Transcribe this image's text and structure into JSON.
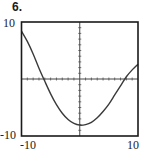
{
  "problem": {
    "number": "6."
  },
  "axes": {
    "y_top_label": "10",
    "y_bottom_label": "-10",
    "x_left_label": "-10",
    "x_right_label": "10"
  },
  "chart_data": {
    "type": "line",
    "title": "6.",
    "xlabel": "",
    "ylabel": "",
    "xlim": [
      -10,
      10
    ],
    "ylim": [
      -10,
      10
    ],
    "x_ticks": [
      "-10",
      "10"
    ],
    "y_ticks": [
      "-10",
      "10"
    ],
    "axes_tick_spacing": 1,
    "grid": false,
    "series": [
      {
        "name": "f(x)",
        "x": [
          -10,
          -9,
          -8,
          -7,
          -6,
          -5,
          -4,
          -3,
          -2,
          -1,
          0,
          1,
          2,
          3,
          4,
          5,
          6,
          7,
          8,
          9,
          10
        ],
        "values": [
          8.4,
          6.6,
          4.4,
          1.9,
          -0.4,
          -2.6,
          -4.5,
          -6.0,
          -7.1,
          -7.8,
          -8.1,
          -8.0,
          -7.6,
          -6.8,
          -5.7,
          -4.4,
          -2.8,
          -1.2,
          0.4,
          1.6,
          2.6
        ]
      }
    ],
    "features": {
      "x_intercepts": [
        -6.1,
        8.3
      ],
      "minimum": [
        0,
        -8.1
      ]
    }
  }
}
